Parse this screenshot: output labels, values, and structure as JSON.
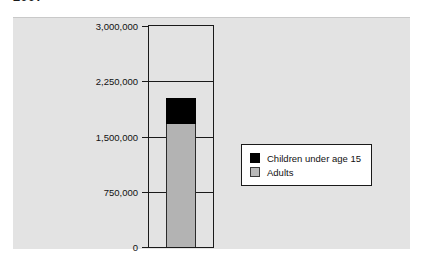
{
  "title_fragment": "2007",
  "chart_data": {
    "type": "bar",
    "subtype": "stacked-column",
    "title": "",
    "xlabel": "",
    "ylabel": "",
    "categories": [
      ""
    ],
    "series": [
      {
        "name": "Adults",
        "values": [
          1670000
        ],
        "color": "#b3b3b3"
      },
      {
        "name": "Children under age 15",
        "values": [
          350000
        ],
        "color": "#000000"
      }
    ],
    "stack_total": 2020000,
    "ylim": [
      0,
      3000000
    ],
    "yticks": [
      0,
      750000,
      1500000,
      2250000,
      3000000
    ],
    "ytick_labels": [
      "0",
      "750,000",
      "1,500,000",
      "2,250,000",
      "3,000,000"
    ],
    "grid": true,
    "legend_position": "right"
  },
  "legend": {
    "items": [
      {
        "label": "Children under age 15",
        "color": "#000000"
      },
      {
        "label": "Adults",
        "color": "#b8b8b8"
      }
    ]
  }
}
